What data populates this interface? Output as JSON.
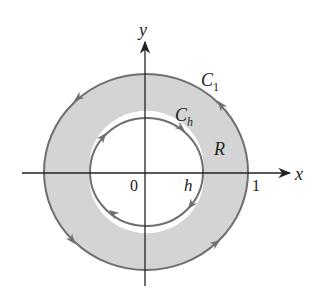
{
  "diagram": {
    "axes": {
      "x_label": "x",
      "y_label": "y",
      "origin_label": "0",
      "x_tick_label": "1"
    },
    "curves": {
      "outer": {
        "label": "C",
        "subscript": "1",
        "orientation": "counterclockwise"
      },
      "inner": {
        "label": "C",
        "subscript": "h",
        "orientation": "clockwise"
      }
    },
    "region": {
      "label": "R"
    },
    "inner_radius_label": "h",
    "colors": {
      "region_fill": "#d4d4d4",
      "curve_stroke": "#6e6e6e",
      "axis": "#222222",
      "background": "#ffffff"
    }
  }
}
